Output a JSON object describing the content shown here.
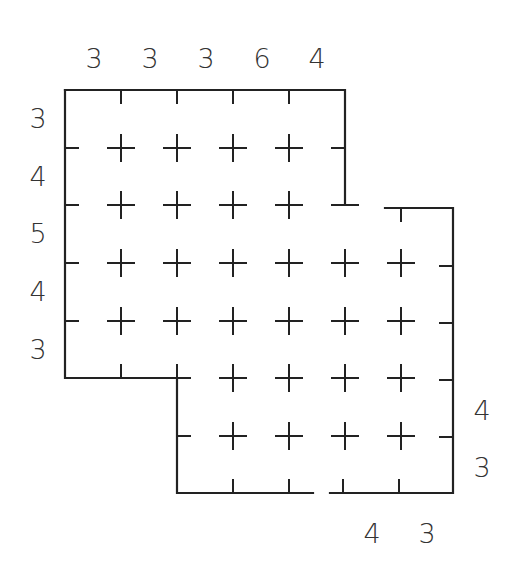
{
  "puzzle": {
    "colors": {
      "line": "#222222",
      "clue": "#333333",
      "background": "#ffffff"
    },
    "grid": {
      "cols_x": [
        65,
        121,
        177,
        233,
        289,
        345,
        401,
        453
      ],
      "rows_y": [
        90,
        148,
        205,
        263,
        321,
        378,
        436,
        493
      ]
    },
    "top_clues": [
      {
        "value": "3",
        "x": 94
      },
      {
        "value": "3",
        "x": 150
      },
      {
        "value": "3",
        "x": 206
      },
      {
        "value": "6",
        "x": 262
      },
      {
        "value": "4",
        "x": 317
      }
    ],
    "left_clues": [
      {
        "value": "3",
        "y": 119
      },
      {
        "value": "4",
        "y": 177
      },
      {
        "value": "5",
        "y": 234
      },
      {
        "value": "4",
        "y": 292
      },
      {
        "value": "3",
        "y": 350
      }
    ],
    "right_clues": [
      {
        "value": "4",
        "y": 411
      },
      {
        "value": "3",
        "y": 468
      }
    ],
    "bottom_clues": [
      {
        "value": "4",
        "x": 372
      },
      {
        "value": "3",
        "x": 427
      }
    ]
  }
}
